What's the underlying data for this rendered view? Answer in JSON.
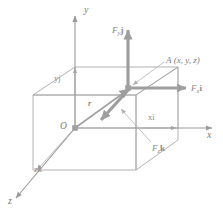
{
  "figure": {
    "colors": {
      "axis": "#9a9a9a",
      "box_edge": "#a8a8a8",
      "vector_arrow": "#9e9e9e",
      "leader_line": "#b0b0b0",
      "text": "#8a8a8a",
      "background": "#ffffff"
    },
    "axes": {
      "x_label": "x",
      "y_label": "y",
      "z_label": "z"
    },
    "origin": {
      "label": "O"
    },
    "point": {
      "name": "A",
      "coordinates": "(x, y, z)",
      "full_label": "A (x, y, z)"
    },
    "position_vector": {
      "label": "r"
    },
    "components": {
      "x_component": "xi",
      "y_component": "yj",
      "z_component": "zk"
    },
    "forces": [
      {
        "id": "fx",
        "base": "F",
        "subscript": "x",
        "unit_vector": "i",
        "label": "F x i",
        "direction": "positive-x"
      },
      {
        "id": "fy",
        "base": "F",
        "subscript": "y",
        "unit_vector": "j",
        "label": "F y j",
        "direction": "positive-y"
      },
      {
        "id": "fz",
        "base": "F",
        "subscript": "z",
        "unit_vector": "k",
        "label": "F z k",
        "direction": "positive-z"
      }
    ]
  }
}
